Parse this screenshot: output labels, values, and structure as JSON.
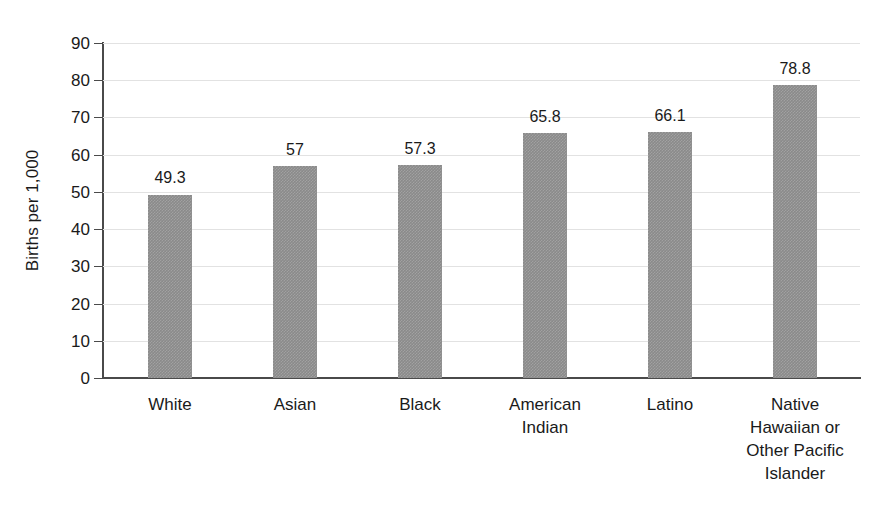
{
  "chart_data": {
    "type": "bar",
    "title": "",
    "subtitle": "",
    "xlabel": "",
    "ylabel": "Births per 1,000",
    "ylim": [
      0,
      90
    ],
    "ytick_step": 10,
    "yticks": [
      "90",
      "80",
      "70",
      "60",
      "50",
      "40",
      "30",
      "20",
      "10",
      "0"
    ],
    "grid": true,
    "grid_axis": "y",
    "legend": false,
    "legend_position": "none",
    "orientation": "vertical",
    "categories": [
      "White",
      "Asian",
      "Black",
      "American Indian",
      "Latino",
      "Native Hawaiian or Other Pacific Islander"
    ],
    "category_label_lines": [
      [
        "White"
      ],
      [
        "Asian"
      ],
      [
        "Black"
      ],
      [
        "American",
        "Indian"
      ],
      [
        "Latino"
      ],
      [
        "Native",
        "Hawaiian or",
        "Other Pacific",
        "Islander"
      ]
    ],
    "values": [
      49.3,
      57,
      57.3,
      65.8,
      66.1,
      78.8
    ],
    "value_labels": [
      "49.3",
      "57",
      "57.3",
      "65.8",
      "66.1",
      "78.8"
    ],
    "colors": {
      "bar_fill": "#8a8a8a",
      "axis_line": "#4a4a4a",
      "gridline": "#e2e2e2",
      "text": "#1a1a1a",
      "background": "#ffffff"
    }
  }
}
